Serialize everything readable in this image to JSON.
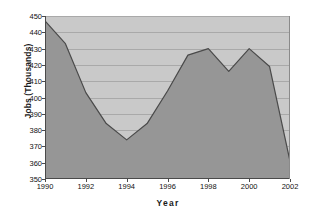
{
  "chart_data": {
    "type": "area",
    "title": "",
    "xlabel": "Year",
    "ylabel": "Jobs (Thousands)",
    "x": [
      1990,
      1991,
      1992,
      1993,
      1994,
      1995,
      1996,
      1997,
      1998,
      1999,
      2000,
      2001,
      2002
    ],
    "values": [
      447,
      433,
      403,
      384,
      374,
      384,
      404,
      426,
      430,
      416,
      430,
      419,
      361
    ],
    "series": [
      {
        "name": "Jobs",
        "values": [
          447,
          433,
          403,
          384,
          374,
          384,
          404,
          426,
          430,
          416,
          430,
          419,
          361
        ]
      }
    ],
    "xlim": [
      1990,
      2002
    ],
    "ylim": [
      350,
      450
    ],
    "y_ticks": [
      350,
      360,
      370,
      380,
      390,
      400,
      410,
      420,
      430,
      440,
      450
    ],
    "y_tick_labels": [
      "350",
      "360",
      "370",
      "380",
      "390",
      "400",
      "410",
      "420",
      "430",
      "440",
      "450"
    ],
    "x_ticks": [
      1990,
      1992,
      1994,
      1996,
      1998,
      2000,
      2002
    ],
    "x_tick_labels": [
      "1990",
      "1992",
      "1994",
      "1996",
      "1998",
      "2000",
      "2002"
    ],
    "grid": true,
    "grid_axis": "y",
    "legend": false,
    "legend_position": "none",
    "colors": {
      "area_fill": "#969696",
      "line": "#4a4a4a",
      "plot_background": "#c9c9c9",
      "gridline": "#a9a9a9",
      "axis": "#4a4a4a",
      "text": "#111111",
      "page_background": "#ffffff"
    }
  }
}
